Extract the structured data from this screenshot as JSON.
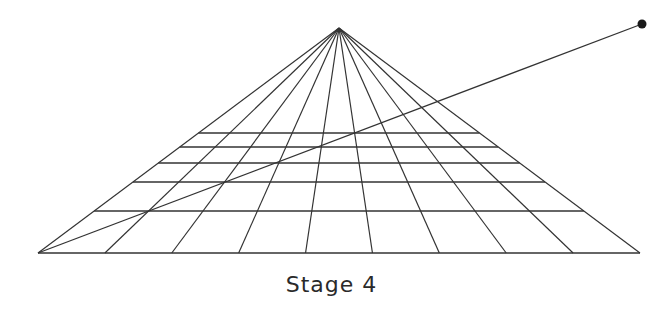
{
  "caption": "Stage 4",
  "colors": {
    "line": "#333333",
    "background": "#ffffff"
  },
  "geometry": {
    "vanishing_point": [
      339,
      28
    ],
    "base_y": 253,
    "base_left_x": 38,
    "base_right_x": 640,
    "divisions": 9,
    "horizontal_lines_y": [
      253,
      211,
      182,
      163,
      147,
      133
    ],
    "diagonal_start": [
      38,
      253
    ],
    "diagonal_end": [
      642,
      24
    ],
    "endpoint_dot_radius": 4.5
  }
}
